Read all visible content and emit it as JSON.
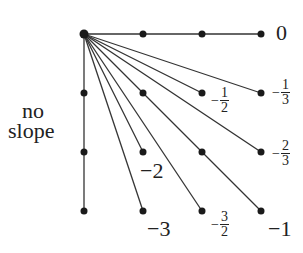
{
  "diagram": {
    "origin": [
      0,
      0
    ],
    "grid_spacing_px": 59,
    "points": [
      [
        0,
        0
      ],
      [
        1,
        0
      ],
      [
        2,
        0
      ],
      [
        3,
        0
      ],
      [
        0,
        1
      ],
      [
        2,
        1
      ],
      [
        3,
        1
      ],
      [
        0,
        2
      ],
      [
        1,
        2
      ],
      [
        3,
        2
      ],
      [
        0,
        3
      ],
      [
        1,
        3
      ],
      [
        2,
        3
      ],
      [
        3,
        3
      ]
    ],
    "lines": [
      {
        "to": [
          3,
          0
        ],
        "slope": "0"
      },
      {
        "to": [
          3,
          1
        ],
        "slope": "-1/3"
      },
      {
        "to": [
          2,
          1
        ],
        "slope": "-1/2"
      },
      {
        "to": [
          3,
          2
        ],
        "slope": "-2/3"
      },
      {
        "to": [
          3,
          3
        ],
        "slope": "-1"
      },
      {
        "to": [
          2,
          3
        ],
        "slope": "-3/2"
      },
      {
        "to": [
          1,
          2
        ],
        "slope": "-2"
      },
      {
        "to": [
          1,
          3
        ],
        "slope": "-3"
      },
      {
        "to": [
          0,
          3
        ],
        "slope": "no slope"
      }
    ],
    "labels": {
      "zero": "0",
      "no_slope_1": "no",
      "no_slope_2": "slope",
      "neg_two": "−2",
      "neg_three": "−3",
      "neg_one": "−1",
      "neg_sign": "−",
      "half_num": "1",
      "half_den": "2",
      "third_num": "1",
      "third_den": "3",
      "twothirds_num": "2",
      "twothirds_den": "3",
      "threehalves_num": "3",
      "threehalves_den": "2"
    },
    "colors": {
      "line": "#333333",
      "dot": "#1a1a1a",
      "text": "#222222"
    }
  }
}
